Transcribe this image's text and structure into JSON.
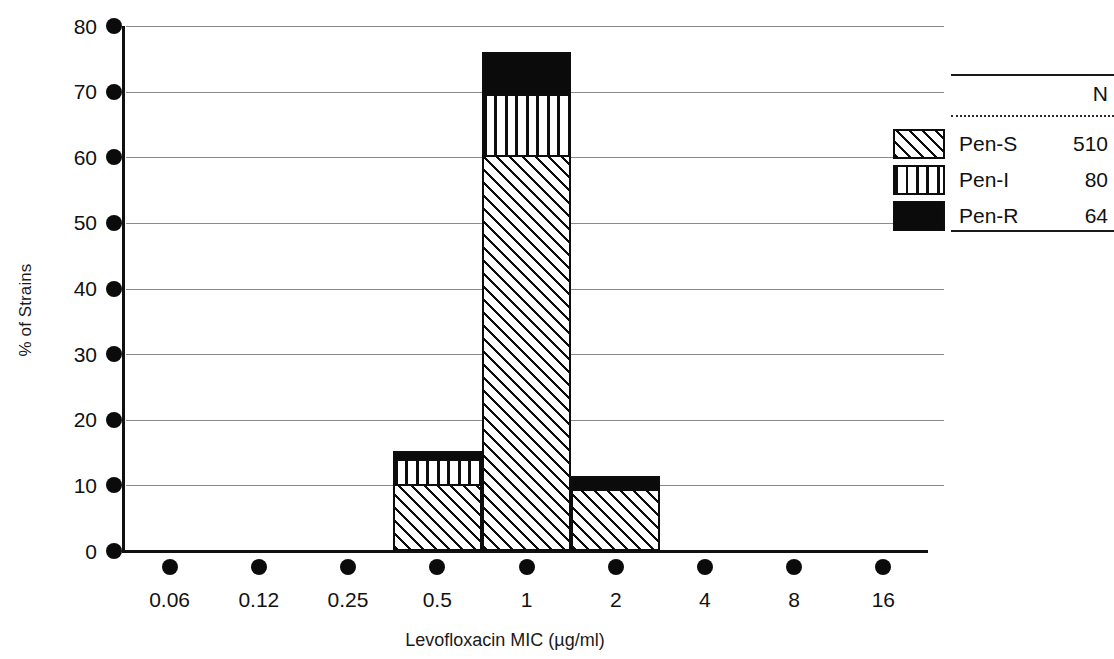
{
  "chart_data": {
    "type": "bar",
    "subtype": "stacked-bar",
    "title": "",
    "xlabel": "Levofloxacin MIC (µg/ml)",
    "ylabel": "% of Strains",
    "categories": [
      "0.06",
      "0.12",
      "0.25",
      "0.5",
      "1",
      "2",
      "4",
      "8",
      "16"
    ],
    "series": [
      {
        "name": "Pen-S",
        "n": 510,
        "pattern": "diagonal-hatch",
        "values": [
          0,
          0,
          0,
          10.0,
          60.2,
          9.3,
          0,
          0,
          0
        ]
      },
      {
        "name": "Pen-I",
        "n": 80,
        "pattern": "vertical-stripe",
        "values": [
          0,
          0,
          0,
          4.0,
          9.4,
          0,
          0,
          0,
          0
        ]
      },
      {
        "name": "Pen-R",
        "n": 64,
        "pattern": "solid-black",
        "values": [
          0,
          0,
          0,
          1.2,
          6.4,
          2.1,
          0,
          0,
          0
        ]
      }
    ],
    "totals": [
      0,
      0,
      0,
      15.2,
      76.0,
      11.4,
      0,
      0,
      0
    ],
    "yticks": [
      0,
      10,
      20,
      30,
      40,
      50,
      60,
      70,
      80
    ],
    "ylim": [
      0,
      80
    ],
    "grid": true,
    "grid_axis": "y",
    "legend_position": "right",
    "colors": {
      "ink": "#0d0d0d",
      "grid": "#8a8a8a",
      "background": "#ffffff"
    }
  },
  "legend": {
    "header": "N",
    "rows": [
      {
        "label": "Pen-S",
        "n": "510"
      },
      {
        "label": "Pen-I",
        "n": "80"
      },
      {
        "label": "Pen-R",
        "n": "64"
      }
    ]
  }
}
